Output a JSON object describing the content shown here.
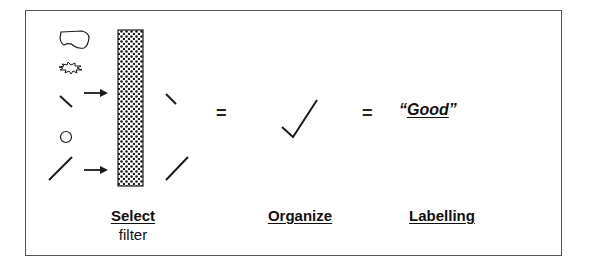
{
  "diagram": {
    "stages": [
      {
        "id": "select",
        "title": "Select",
        "subtitle": "filter"
      },
      {
        "id": "organize",
        "title": "Organize"
      },
      {
        "id": "labelling",
        "title": "Labelling"
      }
    ],
    "operators": [
      "=",
      "="
    ],
    "result_label": {
      "open_quote": "“",
      "word": "Good",
      "close_quote": "”"
    },
    "inputs": [
      "blob-shape",
      "starburst-shape",
      "short-line-backslash",
      "circle-shape",
      "long-line-slash"
    ],
    "outputs": [
      "short-line-backslash",
      "long-line-slash"
    ],
    "organized_symbol": "checkmark",
    "colors": {
      "stroke": "#1a1a1a",
      "border": "#555555",
      "background": "#ffffff"
    }
  }
}
